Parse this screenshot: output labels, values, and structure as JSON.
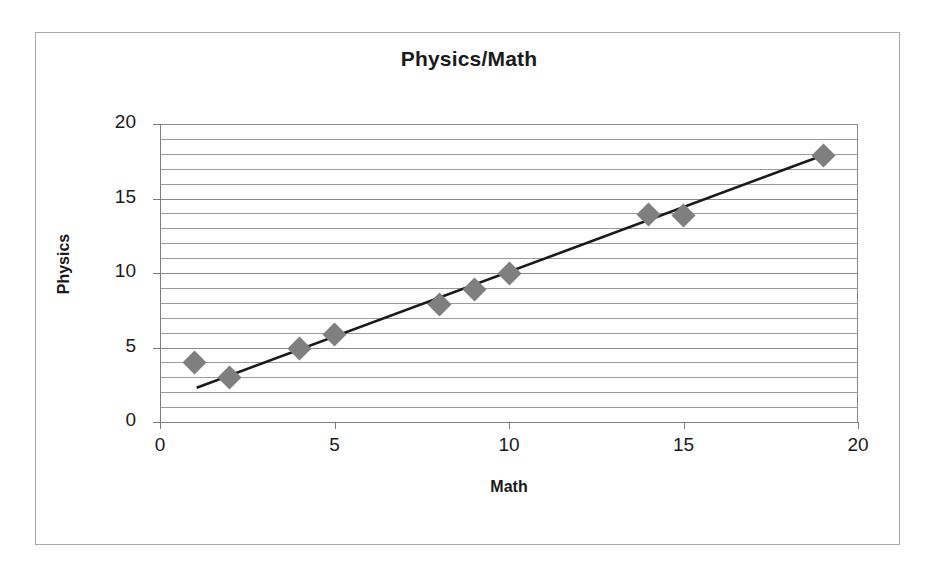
{
  "chart_data": {
    "type": "scatter",
    "title": "Physics/Math",
    "xlabel": "Math",
    "ylabel": "Physics",
    "xlim": [
      0,
      20
    ],
    "ylim": [
      0,
      20
    ],
    "xticks": [
      "0",
      "5",
      "10",
      "15",
      "20"
    ],
    "yticks": [
      "0",
      "5",
      "10",
      "15",
      "20"
    ],
    "xtick_values": [
      0,
      5,
      10,
      15,
      20
    ],
    "ytick_values": [
      0,
      5,
      10,
      15,
      20
    ],
    "grid": "horizontal minor gridlines every 1 unit",
    "legend": "none",
    "marker_shape": "diamond",
    "marker_color": "#7f7f7f",
    "trendline_color": "#1a1a1a",
    "series": [
      {
        "name": "Physics vs Math",
        "x": [
          1,
          2,
          4,
          5,
          8,
          9,
          10,
          14,
          15,
          19
        ],
        "y": [
          4.0,
          3.0,
          4.9,
          5.9,
          7.9,
          8.9,
          10.0,
          13.9,
          13.85,
          17.9
        ],
        "points": [
          {
            "x": 1,
            "y": 4.0
          },
          {
            "x": 2,
            "y": 3.0
          },
          {
            "x": 4,
            "y": 4.9
          },
          {
            "x": 5,
            "y": 5.9
          },
          {
            "x": 8,
            "y": 7.9
          },
          {
            "x": 9,
            "y": 8.9
          },
          {
            "x": 10,
            "y": 10.0
          },
          {
            "x": 14,
            "y": 13.9
          },
          {
            "x": 15,
            "y": 13.85
          },
          {
            "x": 19,
            "y": 17.9
          }
        ]
      }
    ],
    "trendline": {
      "type": "linear",
      "x_start": 1.05,
      "y_start": 2.3,
      "x_end": 19.0,
      "y_end": 17.9
    }
  }
}
